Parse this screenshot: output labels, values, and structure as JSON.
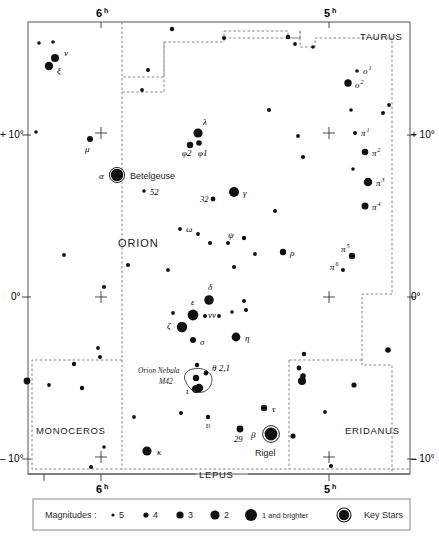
{
  "chart_data": {
    "type": "scatter",
    "title": "ORION",
    "subtitle": "",
    "xlabel": "Right Ascension (hours)",
    "ylabel": "Declination (degrees)",
    "projection": "equatorial star chart",
    "grid": false,
    "xlim": [
      6.45,
      4.55
    ],
    "ylim": [
      -12.5,
      17.0
    ],
    "x_tick_labels": [
      "6",
      "5"
    ],
    "x_tick_superscript": "h",
    "y_tick_labels": [
      "+ 10°",
      "0°",
      "– 10°"
    ],
    "y_tick_values": [
      10,
      0,
      -10
    ],
    "legend_position": "below chart",
    "magnitude_legend": {
      "label": "Magnitudes :",
      "entries": [
        {
          "label": "5",
          "radius_px": 1.6
        },
        {
          "label": "4",
          "radius_px": 2.6
        },
        {
          "label": "3",
          "radius_px": 3.6
        },
        {
          "label": "2",
          "radius_px": 4.6
        },
        {
          "label": "1 and brighter",
          "radius_px": 6.0
        },
        {
          "label": "Key Stars",
          "radius_px": 5.4,
          "ring": true
        }
      ]
    },
    "constellation_labels": [
      {
        "name": "ORION",
        "x": 118,
        "y": 243,
        "size": "large"
      },
      {
        "name": "TAURUS",
        "x": 385,
        "y": 37,
        "size": "small"
      },
      {
        "name": "MONOCEROS",
        "x": 60,
        "y": 431,
        "size": "small"
      },
      {
        "name": "ERIDANUS",
        "x": 377,
        "y": 431,
        "size": "small"
      },
      {
        "name": "LEPUS",
        "x": 216,
        "y": 482,
        "size": "small"
      }
    ],
    "annotations": [
      {
        "text": "Orion Nebula",
        "x": 140,
        "y": 371
      },
      {
        "text": "M42",
        "x": 162,
        "y": 382
      }
    ],
    "named_stars": [
      {
        "name": "Betelgeuse",
        "designation": "α",
        "x": 117,
        "y": 175,
        "mag_class": 1,
        "key_star": true,
        "label_x": 131,
        "label_y": 178,
        "greek_x": 101,
        "greek_y": 178
      },
      {
        "name": "Rigel",
        "designation": "β",
        "x": 271,
        "y": 434,
        "mag_class": 1,
        "key_star": true,
        "label_x": 271,
        "label_y": 453,
        "greek_x": 253,
        "greek_y": 437
      }
    ],
    "labeled_stars": [
      {
        "label": "ν",
        "sup": "",
        "x": 55,
        "y": 58,
        "r": 4.0,
        "lx": 64,
        "ly": 56
      },
      {
        "label": "ξ",
        "sup": "",
        "x": 49,
        "y": 66,
        "r": 4.2,
        "lx": 57,
        "ly": 74
      },
      {
        "label": "o",
        "sup": "1",
        "x": 357,
        "y": 71,
        "r": 1.8,
        "lx": 363,
        "ly": 74
      },
      {
        "label": "o",
        "sup": "2",
        "x": 348,
        "y": 83,
        "r": 3.7,
        "lx": 355,
        "ly": 88
      },
      {
        "label": "μ",
        "sup": "",
        "x": 90,
        "y": 139,
        "r": 3.0,
        "lx": 85,
        "ly": 152
      },
      {
        "label": "λ",
        "sup": "",
        "x": 198,
        "y": 133,
        "r": 4.6,
        "lx": 203,
        "ly": 125
      },
      {
        "label": "φ2",
        "sup": "",
        "x": 190,
        "y": 145,
        "r": 3.2,
        "lx": 182,
        "ly": 156
      },
      {
        "label": "φ1",
        "sup": "",
        "x": 199,
        "y": 143,
        "r": 2.8,
        "lx": 198,
        "ly": 156
      },
      {
        "label": "52",
        "sup": "",
        "x": 144,
        "y": 191,
        "r": 1.8,
        "lx": 150,
        "ly": 195
      },
      {
        "label": "32",
        "sup": "",
        "x": 213,
        "y": 199,
        "r": 2.4,
        "lx": 200,
        "ly": 202
      },
      {
        "label": "γ",
        "sup": "",
        "x": 234,
        "y": 192,
        "r": 5.0,
        "lx": 243,
        "ly": 196
      },
      {
        "label": "π",
        "sup": "1",
        "x": 355,
        "y": 133,
        "r": 2.0,
        "lx": 361,
        "ly": 136
      },
      {
        "label": "π",
        "sup": "2",
        "x": 365,
        "y": 152,
        "r": 3.3,
        "lx": 372,
        "ly": 156
      },
      {
        "label": "π",
        "sup": "3",
        "x": 368,
        "y": 182,
        "r": 4.3,
        "lx": 376,
        "ly": 186
      },
      {
        "label": "π",
        "sup": "4",
        "x": 365,
        "y": 206,
        "r": 3.5,
        "lx": 372,
        "ly": 210
      },
      {
        "label": "π",
        "sup": "5",
        "x": 352,
        "y": 256,
        "r": 3.2,
        "lx": 341,
        "ly": 252
      },
      {
        "label": "π",
        "sup": "6",
        "x": 343,
        "y": 270,
        "r": 2.0,
        "lx": 330,
        "ly": 270
      },
      {
        "label": "ω",
        "sup": "",
        "x": 180,
        "y": 229,
        "r": 1.9,
        "lx": 186,
        "ly": 232
      },
      {
        "label": "ψ",
        "sup": "",
        "x": 228,
        "y": 243,
        "r": 2.0,
        "lx": 228,
        "ly": 238
      },
      {
        "label": "ρ",
        "sup": "",
        "x": 283,
        "y": 252,
        "r": 3.2,
        "lx": 290,
        "ly": 256
      },
      {
        "label": "δ",
        "sup": "",
        "x": 209,
        "y": 300,
        "r": 4.8,
        "lx": 208,
        "ly": 290
      },
      {
        "label": "ε",
        "sup": "",
        "x": 193,
        "y": 315,
        "r": 5.4,
        "lx": 191,
        "ly": 305
      },
      {
        "label": "ζ",
        "sup": "",
        "x": 182,
        "y": 327,
        "r": 5.2,
        "lx": 167,
        "ly": 329
      },
      {
        "label": "σ",
        "sup": "",
        "x": 193,
        "y": 340,
        "r": 3.0,
        "lx": 200,
        "ly": 345
      },
      {
        "label": "νν",
        "sup": "",
        "x": 205,
        "y": 316,
        "r": 2.0,
        "lx": 208,
        "ly": 318
      },
      {
        "label": "η",
        "sup": "",
        "x": 236,
        "y": 337,
        "r": 4.4,
        "lx": 245,
        "ly": 341
      },
      {
        "label": "θ 2,1",
        "sup": "",
        "x": 206,
        "y": 373,
        "r": 2.4,
        "lx": 212,
        "ly": 371
      },
      {
        "label": "ι",
        "sup": "",
        "x": 196,
        "y": 389,
        "r": 4.0,
        "lx": 186,
        "ly": 394
      },
      {
        "label": "τ",
        "sup": "",
        "x": 264,
        "y": 408,
        "r": 3.2,
        "lx": 272,
        "ly": 412
      },
      {
        "label": "υ",
        "sup": "",
        "x": 208,
        "y": 417,
        "r": 2.2,
        "lx": 206,
        "ly": 428
      },
      {
        "label": "29",
        "sup": "",
        "x": 240,
        "y": 429,
        "r": 3.4,
        "lx": 234,
        "ly": 442
      },
      {
        "label": "κ",
        "sup": "",
        "x": 147,
        "y": 451,
        "r": 4.6,
        "lx": 157,
        "ly": 455
      }
    ],
    "unlabeled_stars": [
      {
        "x": 39,
        "y": 43,
        "r": 1.8
      },
      {
        "x": 53,
        "y": 42,
        "r": 1.8
      },
      {
        "x": 172,
        "y": 29,
        "r": 2.2
      },
      {
        "x": 224,
        "y": 38,
        "r": 2.0
      },
      {
        "x": 288,
        "y": 37,
        "r": 2.3
      },
      {
        "x": 295,
        "y": 44,
        "r": 1.9
      },
      {
        "x": 313,
        "y": 47,
        "r": 1.8
      },
      {
        "x": 148,
        "y": 70,
        "r": 2.0
      },
      {
        "x": 142,
        "y": 90,
        "r": 1.9
      },
      {
        "x": 269,
        "y": 110,
        "r": 2.0
      },
      {
        "x": 351,
        "y": 110,
        "r": 1.8
      },
      {
        "x": 389,
        "y": 105,
        "r": 1.9
      },
      {
        "x": 383,
        "y": 113,
        "r": 2.0
      },
      {
        "x": 353,
        "y": 169,
        "r": 1.8
      },
      {
        "x": 298,
        "y": 136,
        "r": 1.9
      },
      {
        "x": 303,
        "y": 157,
        "r": 2.1
      },
      {
        "x": 36,
        "y": 132,
        "r": 1.8
      },
      {
        "x": 275,
        "y": 211,
        "r": 2.0
      },
      {
        "x": 64,
        "y": 255,
        "r": 1.9
      },
      {
        "x": 128,
        "y": 265,
        "r": 2.0
      },
      {
        "x": 198,
        "y": 234,
        "r": 1.9
      },
      {
        "x": 210,
        "y": 243,
        "r": 2.0
      },
      {
        "x": 244,
        "y": 238,
        "r": 2.2
      },
      {
        "x": 255,
        "y": 254,
        "r": 1.9
      },
      {
        "x": 168,
        "y": 270,
        "r": 1.9
      },
      {
        "x": 234,
        "y": 267,
        "r": 2.0
      },
      {
        "x": 104,
        "y": 287,
        "r": 2.0
      },
      {
        "x": 244,
        "y": 301,
        "r": 2.0
      },
      {
        "x": 173,
        "y": 313,
        "r": 1.9
      },
      {
        "x": 219,
        "y": 316,
        "r": 1.9
      },
      {
        "x": 232,
        "y": 312,
        "r": 1.8
      },
      {
        "x": 246,
        "y": 310,
        "r": 2.0
      },
      {
        "x": 98,
        "y": 348,
        "r": 1.9
      },
      {
        "x": 100,
        "y": 357,
        "r": 2.0
      },
      {
        "x": 304,
        "y": 354,
        "r": 2.2
      },
      {
        "x": 388,
        "y": 350,
        "r": 2.8
      },
      {
        "x": 27,
        "y": 381,
        "r": 3.4
      },
      {
        "x": 49,
        "y": 385,
        "r": 1.9
      },
      {
        "x": 82,
        "y": 388,
        "r": 2.2
      },
      {
        "x": 74,
        "y": 364,
        "r": 2.2
      },
      {
        "x": 299,
        "y": 368,
        "r": 2.4
      },
      {
        "x": 303,
        "y": 376,
        "r": 2.8
      },
      {
        "x": 302,
        "y": 381,
        "r": 4.0
      },
      {
        "x": 354,
        "y": 385,
        "r": 2.6
      },
      {
        "x": 134,
        "y": 417,
        "r": 1.9
      },
      {
        "x": 181,
        "y": 413,
        "r": 2.0
      },
      {
        "x": 325,
        "y": 412,
        "r": 1.9
      },
      {
        "x": 293,
        "y": 436,
        "r": 2.6
      },
      {
        "x": 104,
        "y": 447,
        "r": 1.8
      },
      {
        "x": 91,
        "y": 467,
        "r": 2.0
      },
      {
        "x": 331,
        "y": 466,
        "r": 2.0
      },
      {
        "x": 197,
        "y": 365,
        "r": 2.2
      }
    ]
  },
  "figure": {
    "hour_marks": [
      {
        "label": "6",
        "sup": "h",
        "x": 101
      },
      {
        "label": "5",
        "sup": "h",
        "x": 329
      }
    ],
    "dec_marks_left": [
      "+ 10°",
      "0°",
      "– 10°"
    ],
    "dec_marks_right": [
      "+ 10°",
      "0°",
      "– 10°"
    ]
  }
}
